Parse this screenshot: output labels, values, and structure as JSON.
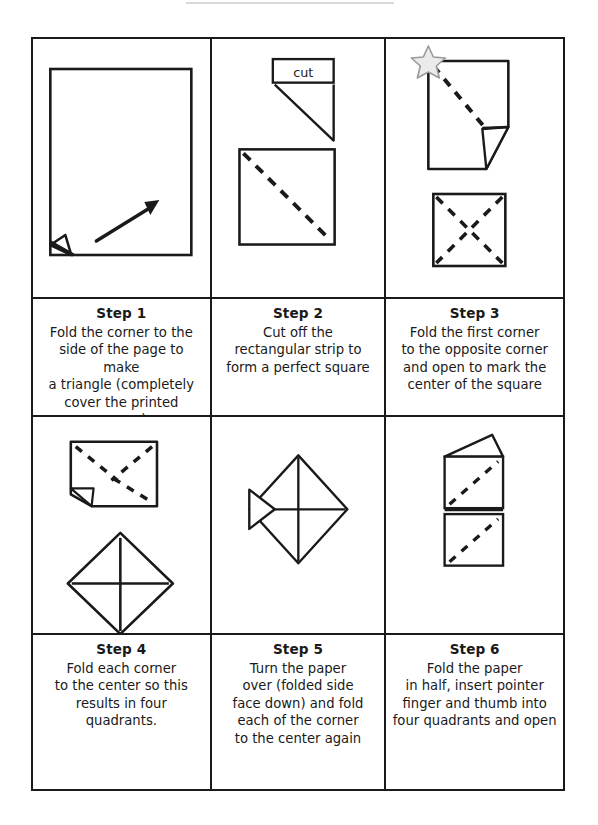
{
  "document": {
    "type": "instruction-sheet",
    "title_rule_visible": true,
    "columns": 3,
    "rows": 2,
    "ink_color": "#1a1a1a",
    "paper_color": "#ffffff",
    "star_fill": "#ebebeb",
    "star_stroke": "#9a9a9a"
  },
  "steps": [
    {
      "id": "step-1",
      "title": "Step 1",
      "body": "Fold the corner to the\nside of the page to make\na triangle (completely\ncover the printed square)",
      "figure": {
        "name": "page-with-arrow-and-folded-corner",
        "elements": [
          "rectangular page outline",
          "diagonal arrow pointing to upper right",
          "small folded corner at bottom left"
        ]
      }
    },
    {
      "id": "step-2",
      "title": "Step 2",
      "body": "Cut off the\nrectangular strip to\nform a perfect square",
      "figure": {
        "name": "cut-strip-and-square-with-diagonal",
        "label": "cut",
        "elements": [
          "labelled strip marked cut",
          "triangle under the strip",
          "square with dashed diagonal fold line"
        ]
      }
    },
    {
      "id": "step-3",
      "title": "Step 3",
      "body": "Fold the first corner\nto the opposite corner\nand open to mark the\ncenter of the square",
      "figure": {
        "name": "square-with-star-and-square-with-x",
        "elements": [
          "square with star at top left corner",
          "dashed diagonal crease",
          "folded corner at bottom right",
          "second square with dashed X creases"
        ]
      }
    },
    {
      "id": "step-4",
      "title": "Step 4",
      "body": "Fold each corner\nto the center so this\nresults in four quadrants.",
      "figure": {
        "name": "rectangle-with-x-and-diamond-with-cross",
        "elements": [
          "rectangle with dashed X and folded bottom-left corner",
          "diamond with solid cross through the center"
        ]
      }
    },
    {
      "id": "step-5",
      "title": "Step 5",
      "body": "Turn the paper\nover (folded side\nface down) and fold\neach of the corner\nto the center again",
      "figure": {
        "name": "diamond-with-cross-and-flap",
        "elements": [
          "diamond with solid cross",
          "small triangular flap lifted on the left side"
        ]
      }
    },
    {
      "id": "step-6",
      "title": "Step 6",
      "body": "Fold the paper\nin half, insert pointer\nfinger and thumb into\nfour quadrants and open",
      "figure": {
        "name": "folded-in-half-with-dashed-diagonals",
        "elements": [
          "two stacked rectangles",
          "dashed diagonal in each half",
          "slanted flap lifted at the top"
        ]
      }
    }
  ]
}
